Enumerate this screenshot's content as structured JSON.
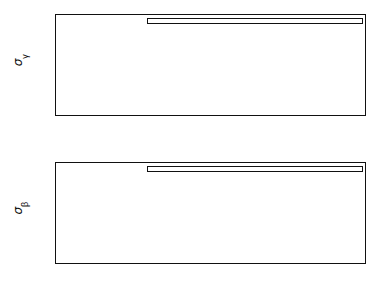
{
  "figure": {
    "type": "multi-panel-line-chart",
    "panels": 2,
    "background": "#ffffff",
    "line_color": "#111111"
  },
  "axis": {
    "xlabel": "Time (days)",
    "xticks": [
      "0",
      "1",
      "2",
      "3",
      "4",
      "5",
      "6",
      "7",
      "8",
      "9",
      "10"
    ],
    "xlim": [
      0,
      10
    ]
  },
  "legend_common": {
    "rows": [
      {
        "style": "dashed",
        "range_label": "Range",
        "range_value": "10",
        "range_exp": "-2",
        "doppler_label": "Doppler",
        "doppler_value": "10",
        "doppler_exp": "-6",
        "vlbi_label": "VLBI",
        "vlbi_value": "5×10",
        "vlbi_exp": "-9"
      },
      {
        "style": "solid",
        "range_label": "Range",
        "range_value": "10",
        "range_exp": "-3",
        "doppler_label": "Doppler",
        "doppler_value": "10",
        "doppler_exp": "-7",
        "vlbi_label": "VLBI",
        "vlbi_value": "10",
        "vlbi_exp": "-9"
      },
      {
        "style": "dotted",
        "range_label": "Range",
        "range_value": "10",
        "range_exp": "-4",
        "doppler_label": "Doppler",
        "doppler_value": "10",
        "doppler_exp": "-8",
        "vlbi_label": "VLBI",
        "vlbi_value": "10",
        "vlbi_exp": "-10"
      }
    ],
    "sigma_symbol": "σ",
    "sigma_subscript": "i",
    "equals": "=",
    "comma": ","
  },
  "chart_data": [
    {
      "id": "panel-top",
      "type": "line",
      "title": "",
      "xlabel": "Time (days)",
      "ylabel": "σ_γ",
      "ylabel_symbol": "σ",
      "ylabel_subscript": "γ",
      "xlim": [
        0,
        10
      ],
      "ylim": [
        1e-05,
        1
      ],
      "yscale": "log",
      "xscale": "linear",
      "yticks": [
        "10^0",
        "10^-1",
        "10^-2",
        "10^-3",
        "10^-4",
        "10^-5"
      ],
      "ytick_exponents": [
        "0",
        "-1",
        "-2",
        "-3",
        "-4",
        "-5"
      ],
      "grid": false,
      "legend_position": "top-right-inside",
      "series": [
        {
          "name": "Range 1e-2, Doppler 1e-6, VLBI 5e-9",
          "style": "dashed",
          "x": [
            0.0,
            0.05,
            0.1,
            0.15,
            0.2,
            0.3,
            0.4,
            0.5,
            0.7,
            1.0,
            1.5,
            2.0,
            2.5,
            3.0,
            3.5,
            4.0,
            4.5,
            5.0,
            5.5,
            6.0,
            6.5,
            7.0,
            7.5,
            8.0,
            8.5,
            9.0,
            9.5,
            10.0
          ],
          "y": [
            0.9,
            0.3,
            0.09,
            0.04,
            0.025,
            0.013,
            0.0095,
            0.0082,
            0.0068,
            0.0055,
            0.0043,
            0.0036,
            0.0031,
            0.0027,
            0.0024,
            0.0022,
            0.002,
            0.00185,
            0.00173,
            0.00163,
            0.00155,
            0.00148,
            0.00142,
            0.00137,
            0.00133,
            0.00129,
            0.00126,
            0.00123
          ]
        },
        {
          "name": "Range 1e-3, Doppler 1e-7, VLBI 1e-9",
          "style": "solid",
          "x": [
            0.0,
            0.05,
            0.1,
            0.15,
            0.2,
            0.3,
            0.4,
            0.45,
            0.5,
            0.7,
            1.0,
            1.5,
            2.0,
            2.5,
            3.0,
            3.5,
            4.0,
            4.5,
            5.0,
            5.5,
            6.0,
            6.5,
            7.0,
            7.5,
            8.0,
            8.5,
            9.0,
            9.5,
            10.0
          ],
          "y": [
            0.95,
            0.2,
            0.05,
            0.02,
            0.009,
            0.0025,
            0.00105,
            0.00098,
            0.00092,
            0.00078,
            0.00062,
            0.00046,
            0.00037,
            0.00031,
            0.00027,
            0.00024,
            0.000218,
            0.000202,
            0.00019,
            0.00018,
            0.000173,
            0.000167,
            0.000163,
            0.000159,
            0.000156,
            0.000154,
            0.000152,
            0.000151,
            0.00015
          ]
        },
        {
          "name": "Range 1e-4, Doppler 1e-8, VLBI 1e-10",
          "style": "dotted",
          "x": [
            0.0,
            0.05,
            0.1,
            0.15,
            0.2,
            0.3,
            0.4,
            0.5,
            0.7,
            1.0,
            1.5,
            2.0,
            2.5,
            3.0,
            3.5,
            4.0,
            4.5,
            5.0,
            5.5,
            6.0,
            6.5,
            7.0,
            7.5,
            8.0,
            8.5,
            9.0,
            9.5,
            10.0
          ],
          "y": [
            0.9,
            0.01,
            0.0013,
            0.00055,
            0.00032,
            0.00017,
            0.00012,
            9.8e-05,
            8e-05,
            6.5e-05,
            5e-05,
            4.2e-05,
            3.6e-05,
            3.2e-05,
            2.9e-05,
            2.68e-05,
            2.5e-05,
            2.36e-05,
            2.25e-05,
            2.16e-05,
            2.09e-05,
            2.03e-05,
            1.98e-05,
            1.94e-05,
            1.91e-05,
            1.88e-05,
            1.86e-05,
            1.84e-05
          ]
        }
      ]
    },
    {
      "id": "panel-bottom",
      "type": "line",
      "title": "",
      "xlabel": "Time (days)",
      "ylabel": "σ_β",
      "ylabel_symbol": "σ",
      "ylabel_subscript": "β",
      "xlim": [
        0,
        10
      ],
      "ylim": [
        0.0001,
        1
      ],
      "yscale": "log",
      "xscale": "linear",
      "yticks": [
        "10^0",
        "10^-1",
        "10^-2",
        "10^-3",
        "10^-4"
      ],
      "ytick_exponents": [
        "0",
        "-1",
        "-2",
        "-3",
        "-4"
      ],
      "grid": false,
      "legend_position": "top-right-inside",
      "series": [
        {
          "name": "Range 1e-2, Doppler 1e-6, VLBI 5e-9",
          "style": "dashed",
          "x": [
            0.0,
            0.05,
            0.1,
            0.2,
            0.3,
            0.5,
            0.7,
            1.0,
            1.5,
            2.0,
            2.5,
            3.0,
            3.5,
            4.0,
            4.5,
            5.0,
            5.5,
            6.0,
            6.5,
            7.0,
            7.5,
            8.0,
            8.5,
            9.0,
            9.5,
            10.0
          ],
          "y": [
            0.07,
            0.055,
            0.048,
            0.04,
            0.035,
            0.03,
            0.027,
            0.024,
            0.0205,
            0.0185,
            0.017,
            0.0158,
            0.0148,
            0.014,
            0.0133,
            0.0126,
            0.012,
            0.0115,
            0.011,
            0.0106,
            0.0102,
            0.0098,
            0.0094,
            0.0091,
            0.0088,
            0.0085
          ]
        },
        {
          "name": "Range 1e-3, Doppler 1e-7, VLBI 1e-9",
          "style": "solid",
          "x": [
            0.0,
            0.03,
            0.06,
            0.1,
            0.15,
            0.2,
            0.3,
            0.4,
            0.5,
            0.7,
            1.0,
            1.5,
            2.0,
            2.5,
            3.0,
            3.5,
            4.0,
            4.5,
            5.0,
            5.5,
            6.0,
            6.5,
            7.0,
            7.5,
            8.0,
            8.5,
            9.0,
            9.5,
            10.0
          ],
          "y": [
            0.075,
            0.045,
            0.025,
            0.013,
            0.0075,
            0.0052,
            0.0034,
            0.0027,
            0.0023,
            0.00195,
            0.0017,
            0.00148,
            0.00137,
            0.0013,
            0.00125,
            0.00122,
            0.00119,
            0.00116,
            0.00114,
            0.00112,
            0.0011,
            0.00108,
            0.00107,
            0.00106,
            0.00105,
            0.00104,
            0.00103,
            0.00102,
            0.00101
          ]
        },
        {
          "name": "Range 1e-4, Doppler 1e-8, VLBI 1e-10",
          "style": "dotted",
          "x": [
            0.0,
            0.05,
            0.1,
            0.2,
            0.3,
            0.5,
            0.7,
            1.0,
            1.5,
            2.0,
            2.5,
            3.0,
            3.5,
            4.0,
            4.5,
            5.0,
            5.5,
            6.0,
            6.5,
            7.0,
            7.5,
            8.0,
            8.5,
            9.0,
            9.5,
            10.0
          ],
          "y": [
            0.0006,
            0.00045,
            0.00039,
            0.00032,
            0.00028,
            0.00024,
            0.000215,
            0.000192,
            0.00017,
            0.000157,
            0.000148,
            0.000141,
            0.000136,
            0.000132,
            0.000128,
            0.000125,
            0.000123,
            0.000121,
            0.000119,
            0.000117,
            0.000116,
            0.000114,
            0.000113,
            0.000112,
            0.000111,
            0.00011
          ]
        }
      ]
    }
  ]
}
